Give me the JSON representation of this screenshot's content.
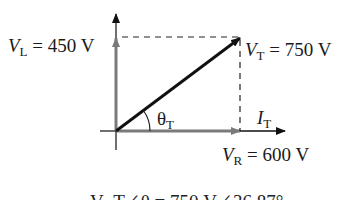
{
  "diagram": {
    "vectors": {
      "VL": {
        "symbol": "V",
        "subscript": "L",
        "eq": " = 450 V",
        "color": "#7a7a7a"
      },
      "VT": {
        "symbol": "V",
        "subscript": "T",
        "eq": " = 750 V",
        "color": "#111111"
      },
      "VR": {
        "symbol": "V",
        "subscript": "R",
        "eq": " = 600 V",
        "color": "#7a7a7a"
      },
      "IT": {
        "symbol": "I",
        "subscript": "T",
        "color": "#111111"
      }
    },
    "angle": {
      "symbol": "θ",
      "subscript": "T"
    },
    "bottom_caption_cropped": "V_T∠θ = 750 V∠36.87°"
  }
}
